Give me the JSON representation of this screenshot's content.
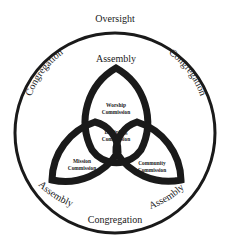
{
  "diagram": {
    "type": "triquetra-in-circle",
    "outer_circle": {
      "top_label": "Oversight",
      "left_label": "Congregation",
      "right_label": "Congregation",
      "bottom_label": "Congregation"
    },
    "petals": {
      "top": {
        "tip_label": "Assembly",
        "inner_label_line1": "Worship",
        "inner_label_line2": "Commission"
      },
      "bottom_left": {
        "tip_label": "Assembly",
        "inner_label_line1": "Mission",
        "inner_label_line2": "Commission"
      },
      "bottom_right": {
        "tip_label": "Assembly",
        "inner_label_line1": "Community",
        "inner_label_line2": "Commission"
      }
    },
    "center": {
      "label_line1": "Discipling",
      "label_line2": "Commission"
    },
    "colors": {
      "stroke": "#1a1a1a",
      "background": "#ffffff"
    }
  }
}
